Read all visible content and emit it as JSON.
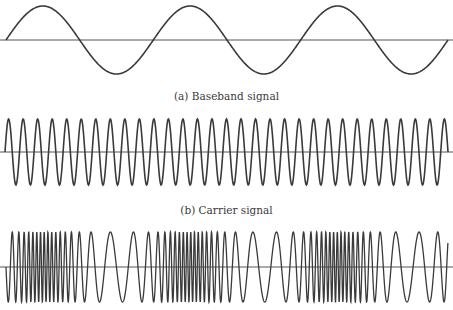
{
  "figure": {
    "captions": {
      "a": "(a) Baseband signal",
      "b": "(b) Carrier signal"
    },
    "colors": {
      "line": "#3a3a3a",
      "axis": "#555555",
      "background": "#ffffff"
    }
  },
  "chart_data": [
    {
      "type": "line",
      "title": "(a) Baseband signal",
      "description": "Low-frequency sine wave, 3 full cycles",
      "cycles": 3,
      "x_start_px": 6,
      "x_end_px": 448,
      "axis_y_px": 40,
      "amplitude_px": 34,
      "phase": "starts at zero going up"
    },
    {
      "type": "line",
      "title": "(b) Carrier signal",
      "description": "High-frequency sine wave of constant frequency",
      "cycles": 30.5,
      "x_start_px": 5,
      "x_end_px": 448,
      "axis_y_px": 152,
      "amplitude_px": 33,
      "phase": "starts at zero going up"
    },
    {
      "type": "line",
      "title": "Frequency-modulated signal",
      "description": "Carrier whose instantaneous frequency follows the baseband: compressed (high frequency) at baseband peaks, stretched (low frequency) at baseband troughs",
      "x_start_px": 6,
      "x_end_px": 448,
      "axis_y_px": 267,
      "amplitude_px": 35,
      "base_period_px": 9.5,
      "modulation_k": 0.95,
      "dense_regions_px": [
        41,
        189,
        337
      ],
      "sparse_regions_px": [
        115,
        263,
        411
      ],
      "phase": "starts at zero going down"
    }
  ]
}
